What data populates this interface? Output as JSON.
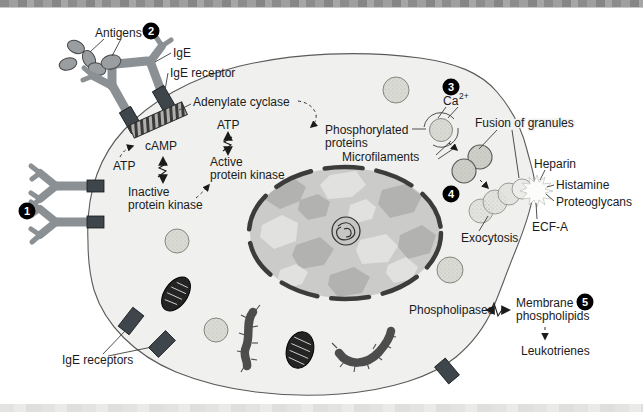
{
  "diagram": {
    "steps": [
      "1",
      "2",
      "3",
      "4",
      "5"
    ],
    "labels": {
      "antigens": "Antigens",
      "ige": "IgE",
      "ige_receptor": "IgE receptor",
      "adenylate_cyclase": "Adenylate cyclase",
      "atp_left": "ATP",
      "camp": "cAMP",
      "inactive_kinase_1": "Inactive",
      "inactive_kinase_2": "protein kinase",
      "atp_top": "ATP",
      "active_kinase_1": "Active",
      "active_kinase_2": "protein kinase",
      "phosphorylated_1": "Phosphorylated",
      "phosphorylated_2": "proteins",
      "microfilaments": "Microfilaments",
      "ca": "Ca",
      "ca_sup": "2+",
      "fusion_of_granules": "Fusion of granules",
      "heparin": "Heparin",
      "histamine": "Histamine",
      "proteoglycans": "Proteoglycans",
      "ecf_a": "ECF-A",
      "exocytosis": "Exocytosis",
      "phospholipases": "Phospholipases",
      "membrane_phospholipids_1": "Membrane",
      "membrane_phospholipids_2": "phospholipids",
      "leukotrienes": "Leukotrienes",
      "ige_receptors": "IgE receptors"
    },
    "colors": {
      "background": "#ffffff",
      "text": "#1b1b1b",
      "cell_fill": "#f0f0ee",
      "membrane": "#5a5a5a",
      "antibody": "#8a9094",
      "receptor": "#3e464c",
      "antigen": "#9a9ea1",
      "granule": "#dbdbd5",
      "granule_fused": "#cfcfc9",
      "granule_pale": "#e3e3df",
      "nucleus_base": "#cbcbc9",
      "nucleus_dark": "#b2b2b0",
      "nucleus_light": "#e1e1df",
      "nucleus_border": "#3c3c3a",
      "mitochondrion": "#242424",
      "rod": "#4d4d4d",
      "badge": "#000000"
    }
  }
}
